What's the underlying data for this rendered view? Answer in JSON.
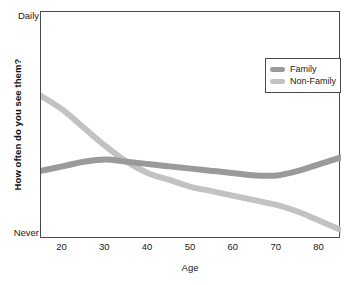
{
  "chart_data": {
    "type": "line",
    "title": "",
    "xlabel": "Age",
    "ylabel": "How often do you see them?",
    "xlim": [
      15,
      85
    ],
    "ylim": [
      0,
      100
    ],
    "grid": false,
    "legend_position": "top-right",
    "xticks": [
      20,
      30,
      40,
      50,
      60,
      70,
      80
    ],
    "xticklabels": [
      "20",
      "30",
      "40",
      "50",
      "60",
      "70",
      "80"
    ],
    "yticks": [
      0,
      100
    ],
    "yticklabels": [
      "Never",
      "Daily"
    ],
    "series": [
      {
        "name": "Family",
        "color": "#9a9a9a",
        "x": [
          15,
          20,
          25,
          30,
          35,
          40,
          45,
          50,
          55,
          60,
          65,
          70,
          75,
          80,
          85
        ],
        "y": [
          30,
          32,
          34,
          35,
          34,
          33,
          32,
          31,
          30,
          29,
          28,
          28,
          30,
          33,
          36
        ]
      },
      {
        "name": "Non-Family",
        "color": "#c2c2c2",
        "x": [
          15,
          20,
          25,
          30,
          35,
          40,
          45,
          50,
          55,
          60,
          65,
          70,
          75,
          80,
          85
        ],
        "y": [
          63,
          57,
          49,
          41,
          34,
          29,
          26,
          23,
          21,
          19,
          17,
          15,
          12,
          8,
          4
        ]
      }
    ],
    "annotations": []
  },
  "axes": {
    "y_title": "How often do you see them?",
    "y_top_label": "Daily",
    "y_bottom_label": "Never",
    "x_title": "Age",
    "x_ticks": [
      "20",
      "30",
      "40",
      "50",
      "60",
      "70",
      "80"
    ]
  },
  "legend": {
    "items": [
      {
        "label": "Family",
        "color": "#9a9a9a"
      },
      {
        "label": "Non-Family",
        "color": "#c2c2c2"
      }
    ]
  },
  "colors": {
    "family": "#9a9a9a",
    "non_family": "#c2c2c2",
    "frame": "#4a4a4a",
    "background": "#ffffff",
    "text": "#1a1a1a"
  }
}
